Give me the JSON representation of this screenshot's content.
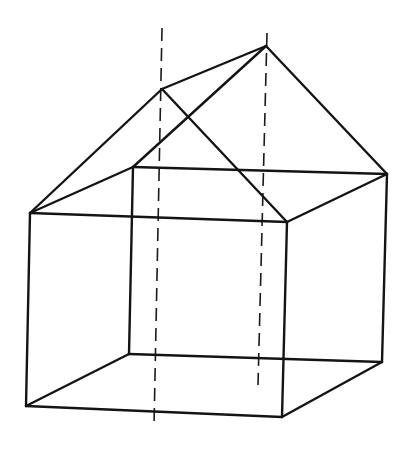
{
  "diagram": {
    "colors": {
      "background": "#ffffff",
      "ink": "#141414"
    },
    "vertices": {
      "front_top_left": [
        30,
        213
      ],
      "front_top_right": [
        287,
        222
      ],
      "front_bottom_left": [
        26,
        406
      ],
      "front_bottom_right": [
        282,
        417
      ],
      "back_top_left": [
        133,
        167
      ],
      "back_top_right": [
        387,
        174
      ],
      "back_bottom_left": [
        129,
        354
      ],
      "back_bottom_right": [
        382,
        362
      ],
      "roof_peak_front": [
        162,
        89
      ],
      "roof_peak_back": [
        266,
        46
      ]
    },
    "solid_edges": [
      [
        "front_top_left",
        "front_top_right"
      ],
      [
        "front_bottom_left",
        "front_bottom_right"
      ],
      [
        "front_top_left",
        "front_bottom_left"
      ],
      [
        "front_top_right",
        "front_bottom_right"
      ],
      [
        "back_top_left",
        "back_top_right"
      ],
      [
        "back_bottom_left",
        "back_bottom_right"
      ],
      [
        "back_top_left",
        "back_bottom_left"
      ],
      [
        "back_top_right",
        "back_bottom_right"
      ],
      [
        "front_top_left",
        "back_top_left"
      ],
      [
        "front_top_right",
        "back_top_right"
      ],
      [
        "front_bottom_left",
        "back_bottom_left"
      ],
      [
        "front_bottom_right",
        "back_bottom_right"
      ],
      [
        "front_top_left",
        "roof_peak_front"
      ],
      [
        "front_top_right",
        "roof_peak_front"
      ],
      [
        "back_top_left",
        "roof_peak_back"
      ],
      [
        "back_top_right",
        "roof_peak_back"
      ],
      [
        "roof_peak_front",
        "roof_peak_back"
      ]
    ],
    "dashed_axes": [
      {
        "name": "front-peak-axis",
        "from": [
          162,
          28
        ],
        "to": [
          154,
          426
        ]
      },
      {
        "name": "back-peak-axis",
        "from": [
          267,
          33
        ],
        "to": [
          258,
          385
        ]
      }
    ]
  }
}
